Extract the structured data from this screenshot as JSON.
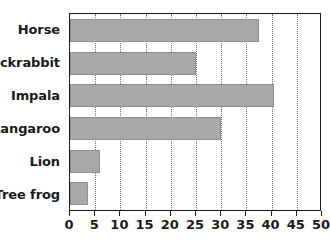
{
  "chart_data": {
    "type": "bar",
    "orientation": "horizontal",
    "title": "",
    "xlabel": "",
    "ylabel": "",
    "categories": [
      "Horse",
      "Jackrabbit",
      "Impala",
      "Kangaroo",
      "Lion",
      "Tree frog"
    ],
    "values": [
      37.5,
      25,
      40.5,
      30,
      6,
      3.5
    ],
    "xlim": [
      0,
      50
    ],
    "xticks": [
      0,
      5,
      10,
      15,
      20,
      25,
      30,
      35,
      40,
      45,
      50
    ],
    "xtick_labels": [
      "0",
      "5",
      "10",
      "15",
      "20",
      "25",
      "30",
      "35",
      "40",
      "45",
      "50"
    ],
    "grid": true,
    "grid_axis": "x",
    "grid_style": "dotted",
    "legend": false,
    "bar_color": "#a8a8a8",
    "bar_border_color": "#8f8f8f",
    "frame_color": "#1a1a1a",
    "background_color": "#ffffff",
    "text_color": "#1a1a1a"
  }
}
